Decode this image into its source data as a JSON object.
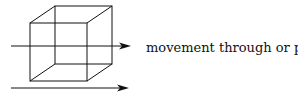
{
  "diagram": {
    "caption": "movement through or past",
    "shape": "wireframe-cube",
    "arrows": [
      {
        "label": "through",
        "y": 46
      },
      {
        "label": "past",
        "y": 88
      }
    ],
    "colors": {
      "stroke": "#111111",
      "background": "#ffffff"
    }
  }
}
